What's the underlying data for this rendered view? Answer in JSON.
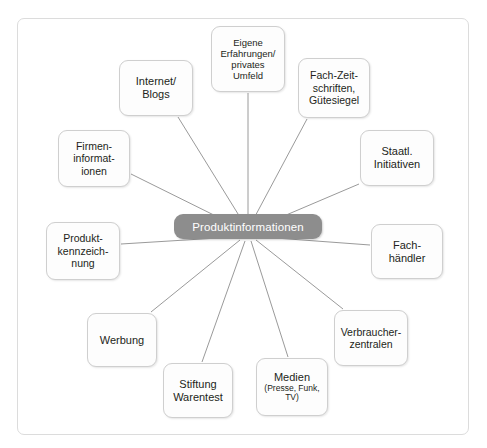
{
  "diagram": {
    "type": "mind-map",
    "center": {
      "label": "Produktinformationen",
      "fill_color": "#8d8d8d",
      "text_color": "#ffffff"
    },
    "frame": {
      "border_color": "#dcdcdc",
      "background": "#ffffff"
    },
    "connector_color": "#9a9a9a",
    "node_style": {
      "fill_color": "#fdfdfd",
      "border_color": "#cfcfcf",
      "text_color": "#231f20"
    },
    "nodes": [
      {
        "id": "eigene-erfahrungen",
        "label": "Eigene\nErfahrungen/\nprivates\nUmfeld",
        "sub": "",
        "x": 211,
        "y": 26,
        "w": 74,
        "h": 66,
        "font_size": 9.5
      },
      {
        "id": "internet-blogs",
        "label": "Internet/\nBlogs",
        "sub": "",
        "x": 119,
        "y": 60,
        "w": 74,
        "h": 56,
        "font_size": 11
      },
      {
        "id": "fach-zeitschriften",
        "label": "Fach-Zeit-\nschriften,\nGütesiegel",
        "sub": "",
        "x": 298,
        "y": 58,
        "w": 72,
        "h": 60,
        "font_size": 10.5
      },
      {
        "id": "firmeninformationen",
        "label": "Firmen-\ninformat-\nionen",
        "sub": "",
        "x": 58,
        "y": 130,
        "w": 72,
        "h": 57,
        "font_size": 10.5
      },
      {
        "id": "staatl-initiativen",
        "label": "Staatl.\nInitiativen",
        "sub": "",
        "x": 360,
        "y": 130,
        "w": 74,
        "h": 56,
        "font_size": 11
      },
      {
        "id": "produktkennzeichnung",
        "label": "Produkt-\nkennzeich-\nnung",
        "sub": "",
        "x": 46,
        "y": 222,
        "w": 74,
        "h": 58,
        "font_size": 10.5
      },
      {
        "id": "fachhaendler",
        "label": "Fach-\nhändler",
        "sub": "",
        "x": 371,
        "y": 224,
        "w": 72,
        "h": 55,
        "font_size": 11
      },
      {
        "id": "werbung",
        "label": "Werbung",
        "sub": "",
        "x": 87,
        "y": 313,
        "w": 70,
        "h": 54,
        "font_size": 11
      },
      {
        "id": "verbraucherzentralen",
        "label": "Verbraucher-\nzentralen",
        "sub": "",
        "x": 334,
        "y": 310,
        "w": 74,
        "h": 56,
        "font_size": 10.5
      },
      {
        "id": "stiftung-warentest",
        "label": "Stiftung\nWarentest",
        "sub": "",
        "x": 163,
        "y": 363,
        "w": 70,
        "h": 55,
        "font_size": 11
      },
      {
        "id": "medien",
        "label": "Medien",
        "sub": "(Presse, Funk,\nTV)",
        "x": 256,
        "y": 358,
        "w": 72,
        "h": 58,
        "font_size": 11
      }
    ]
  }
}
